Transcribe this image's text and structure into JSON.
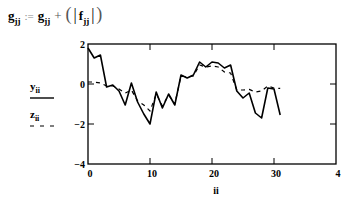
{
  "equation": {
    "lhs": "g",
    "lhs_sub": "jj",
    "assign": ":=",
    "rhs_term1": "g",
    "rhs_term1_sub": "jj",
    "plus": "+",
    "rhs_term2": "f",
    "rhs_term2_sub": "jj",
    "text": "g_jj := g_jj + (|f_jj|)"
  },
  "chart_data": {
    "type": "line",
    "title": "",
    "xlabel": "ii",
    "ylabel": "",
    "xlim": [
      0,
      40
    ],
    "ylim": [
      -4,
      2
    ],
    "x_ticks": [
      0,
      10,
      20,
      30,
      40
    ],
    "x_tick_labels": [
      "0",
      "10",
      "20",
      "30",
      "4"
    ],
    "y_ticks": [
      2,
      0,
      -2,
      -4
    ],
    "y_tick_labels": [
      "2",
      "0",
      "-2",
      "-4"
    ],
    "grid": false,
    "legend_position": "left",
    "x": [
      0,
      1,
      2,
      3,
      4,
      5,
      6,
      7,
      8,
      9,
      10,
      11,
      12,
      13,
      14,
      15,
      16,
      17,
      18,
      19,
      20,
      21,
      22,
      23,
      24,
      25,
      26,
      27,
      28,
      29,
      30,
      31
    ],
    "series": [
      {
        "name": "y_ii",
        "style": "solid",
        "values": [
          1.8,
          1.3,
          1.45,
          -0.15,
          -0.05,
          -0.35,
          -1.05,
          0.05,
          -0.9,
          -1.5,
          -2.0,
          -0.4,
          -1.2,
          -0.5,
          -1.05,
          0.45,
          0.3,
          0.45,
          1.1,
          0.85,
          1.1,
          1.05,
          0.8,
          0.95,
          -0.35,
          -0.7,
          -0.45,
          -1.45,
          -1.7,
          -0.2,
          -0.25,
          -1.55
        ]
      },
      {
        "name": "z_ii",
        "style": "dashed",
        "values": [
          0.1,
          0.1,
          0.05,
          -0.1,
          -0.1,
          -0.25,
          -0.45,
          -0.3,
          -0.85,
          -1.05,
          -1.35,
          -0.5,
          -1.1,
          -0.55,
          -1.0,
          0.4,
          0.35,
          0.4,
          0.95,
          0.85,
          0.9,
          0.85,
          0.6,
          0.55,
          -0.3,
          -0.3,
          -0.27,
          -0.4,
          -0.35,
          -0.1,
          -0.2,
          -0.22
        ]
      }
    ]
  },
  "legend": {
    "items": [
      {
        "name": "y",
        "sub": "ii",
        "style": "solid"
      },
      {
        "name": "z",
        "sub": "ii",
        "style": "dashed"
      }
    ]
  },
  "colors": {
    "line": "#000000",
    "axis": "#000000",
    "background": "#ffffff"
  }
}
